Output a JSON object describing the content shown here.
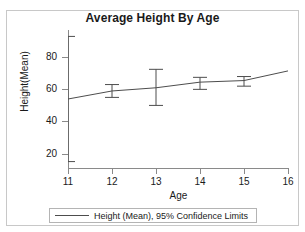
{
  "chart_data": {
    "type": "line",
    "title": "Average Height By Age",
    "xlabel": "Age",
    "ylabel": "Height(Mean)",
    "xlim": [
      11,
      16
    ],
    "ylim": [
      11,
      97
    ],
    "grid": false,
    "legend_position": "bottom",
    "x_ticks": [
      11,
      12,
      13,
      14,
      15,
      16
    ],
    "x_tick_labels": [
      "11",
      "12",
      "13",
      "14",
      "15",
      "16"
    ],
    "y_ticks": [
      20,
      40,
      60,
      80
    ],
    "y_tick_labels": [
      "20",
      "40",
      "60",
      "80"
    ],
    "series": [
      {
        "name": "Height (Mean), 95% Confidence Limits",
        "color": "#4d4d4d",
        "x": [
          11,
          12,
          13,
          14,
          15,
          16
        ],
        "values": [
          54.0,
          59.0,
          61.0,
          64.5,
          65.5,
          71.5
        ],
        "error_bars": [
          {
            "x": 11,
            "mean": 54.0,
            "lower": 15.0,
            "upper": 93.0
          },
          {
            "x": 12,
            "mean": 59.0,
            "lower": 55.0,
            "upper": 63.0
          },
          {
            "x": 13,
            "mean": 61.0,
            "lower": 50.0,
            "upper": 72.5
          },
          {
            "x": 14,
            "mean": 64.5,
            "lower": 60.0,
            "upper": 67.5
          },
          {
            "x": 15,
            "mean": 65.5,
            "lower": 62.0,
            "upper": 68.0
          }
        ]
      }
    ],
    "annotations": []
  },
  "legend": {
    "entries": [
      {
        "label": "Height (Mean), 95% Confidence Limits",
        "color": "#4d4d4d"
      }
    ]
  },
  "colors": {
    "line": "#4d4d4d",
    "axis": "#8a8a8a",
    "frame": "#c8c8c8",
    "text": "#1a1a1a",
    "background": "#ffffff"
  }
}
